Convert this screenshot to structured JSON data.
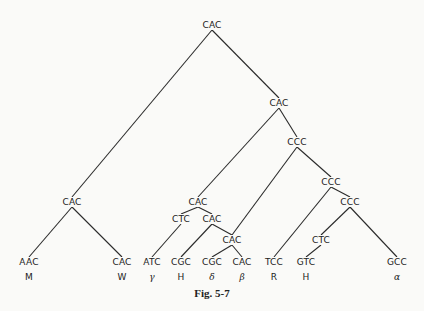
{
  "caption": "Fig. 5-7",
  "nodes": [
    {
      "id": "root",
      "label": "CAC",
      "x": 212,
      "y": 25
    },
    {
      "id": "n1",
      "label": "CAC",
      "x": 279,
      "y": 103
    },
    {
      "id": "n2",
      "label": "CCC",
      "x": 297,
      "y": 142
    },
    {
      "id": "n3",
      "label": "CCC",
      "x": 331,
      "y": 182
    },
    {
      "id": "n4",
      "label": "CCC",
      "x": 350,
      "y": 202
    },
    {
      "id": "n5",
      "label": "CAC",
      "x": 72,
      "y": 202
    },
    {
      "id": "n6",
      "label": "CAC",
      "x": 198,
      "y": 202
    },
    {
      "id": "n7",
      "label": "CTC",
      "x": 181,
      "y": 219
    },
    {
      "id": "n8",
      "label": "CAC",
      "x": 212,
      "y": 219
    },
    {
      "id": "n9",
      "label": "CAC",
      "x": 232,
      "y": 240
    },
    {
      "id": "n10",
      "label": "CTC",
      "x": 321,
      "y": 240
    }
  ],
  "leaves": [
    {
      "id": "l1",
      "label": "AAC",
      "sub": "M",
      "greek": false,
      "x": 29,
      "y": 262
    },
    {
      "id": "l2",
      "label": "CAC",
      "sub": "W",
      "greek": false,
      "x": 122,
      "y": 262
    },
    {
      "id": "l3",
      "label": "ATC",
      "sub": "γ",
      "greek": true,
      "x": 152,
      "y": 262
    },
    {
      "id": "l4",
      "label": "CGC",
      "sub": "H",
      "greek": false,
      "x": 181,
      "y": 262
    },
    {
      "id": "l5",
      "label": "CGC",
      "sub": "δ",
      "greek": true,
      "x": 212,
      "y": 262
    },
    {
      "id": "l6",
      "label": "CAC",
      "sub": "β",
      "greek": true,
      "x": 242,
      "y": 262
    },
    {
      "id": "l7",
      "label": "TCC",
      "sub": "R",
      "greek": false,
      "x": 274,
      "y": 262
    },
    {
      "id": "l8",
      "label": "GTC",
      "sub": "H",
      "greek": false,
      "x": 306,
      "y": 262
    },
    {
      "id": "l9",
      "label": "GCC",
      "sub": "α",
      "greek": true,
      "x": 397,
      "y": 262
    }
  ],
  "edges": [
    [
      "root",
      "n5"
    ],
    [
      "root",
      "n1"
    ],
    [
      "n5",
      "l1"
    ],
    [
      "n5",
      "l2"
    ],
    [
      "n1",
      "n6"
    ],
    [
      "n1",
      "n2"
    ],
    [
      "n2",
      "n9"
    ],
    [
      "n2",
      "n3"
    ],
    [
      "n6",
      "n7"
    ],
    [
      "n6",
      "n8"
    ],
    [
      "n7",
      "l3"
    ],
    [
      "n8",
      "l4"
    ],
    [
      "n8",
      "n9"
    ],
    [
      "n9",
      "l5"
    ],
    [
      "n9",
      "l6"
    ],
    [
      "n3",
      "l7"
    ],
    [
      "n3",
      "n4"
    ],
    [
      "n4",
      "n10"
    ],
    [
      "n4",
      "l9"
    ],
    [
      "n10",
      "l8"
    ]
  ]
}
